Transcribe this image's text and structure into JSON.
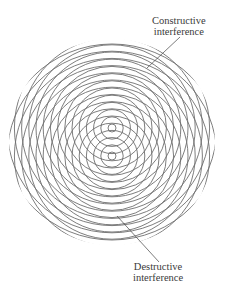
{
  "diagram": {
    "sources": [
      {
        "name": "source-1",
        "cx": 112,
        "cy": 128
      },
      {
        "name": "source-2",
        "cx": 112,
        "cy": 156
      }
    ],
    "ring_spacing": 7.2,
    "first_ring_radius": 4,
    "ring_count": 18,
    "clip_circle": {
      "cx": 112,
      "cy": 142,
      "r": 103
    },
    "stroke_color": "#6e6e6e",
    "stroke_width": 0.9
  },
  "labels": {
    "constructive": {
      "line1": "Constructive",
      "line2": "interference",
      "leader": {
        "x1": 180,
        "y1": 37,
        "x2": 147,
        "y2": 68
      }
    },
    "destructive": {
      "line1": "Destructive",
      "line2": "interference",
      "leader": {
        "x1": 159,
        "y1": 262,
        "x2": 117,
        "y2": 216
      }
    }
  },
  "colors": {
    "background": "#ffffff",
    "rings": "#6e6e6e",
    "text": "#3a3a3a",
    "leader": "#444444"
  }
}
